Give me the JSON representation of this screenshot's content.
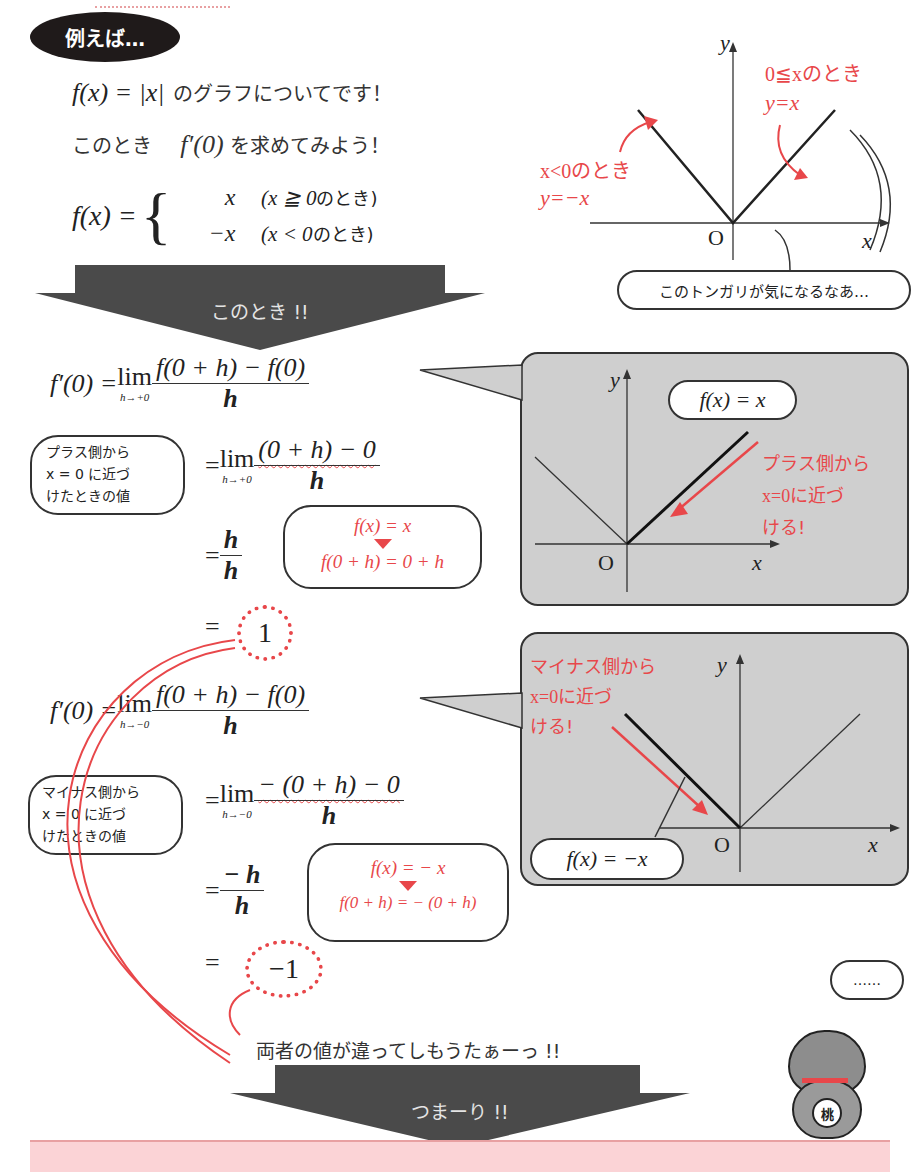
{
  "header": {
    "badge_label": "例えば…"
  },
  "intro": {
    "line1_math": "f(x) = |x|",
    "line1_text": "のグラフについてです！",
    "line2_text_a": "このとき",
    "line2_math": "f′(0)",
    "line2_text_b": "を求めてみよう！",
    "piecewise_lhs": "f(x) =",
    "case1_expr": "x",
    "case1_cond_math": "(x ≧ 0",
    "case1_cond_text": "のとき)",
    "case2_expr": "−x",
    "case2_cond_math": "(x < 0",
    "case2_cond_text": "のとき)"
  },
  "top_graph": {
    "y_label": "y",
    "x_label": "x",
    "origin_label": "O",
    "right_note_line1": "0≦xのとき",
    "right_note_line2": "y=x",
    "left_note_line1": "x<0のとき",
    "left_note_line2": "y=−x",
    "speech": "このトンガリが気になるなあ…"
  },
  "arrow1": {
    "label": "このとき !!"
  },
  "plus_side": {
    "line1_lhs": "f′(0) =",
    "lim_word": "lim",
    "lim_sub": "h→+0",
    "line1_num": "f(0 + h) − f(0)",
    "line1_den": "h",
    "line2_num": "(0 + h) − 0",
    "line2_den": "h",
    "line3_num": "h",
    "line3_den": "h",
    "result": "1",
    "eq": "=",
    "bubble_left": [
      "プラス側から",
      "x = 0 に近づ",
      "けたときの値"
    ],
    "bubble_hint_line1": "f(x) = x",
    "bubble_hint_line2": "f(0 + h) = 0 + h"
  },
  "plus_graph": {
    "y_label": "y",
    "x_label": "x",
    "origin_label": "O",
    "func_label": "f(x) = x",
    "note": [
      "プラス側から",
      "x=0に近づ",
      "ける!"
    ]
  },
  "minus_side": {
    "line1_lhs": "f′(0) =",
    "lim_word": "lim",
    "lim_sub": "h→−0",
    "line1_num": "f(0 + h) − f(0)",
    "line1_den": "h",
    "line2_num": "− (0 + h) − 0",
    "line2_den": "h",
    "line3_num": "− h",
    "line3_den": "h",
    "result": "−1",
    "eq": "=",
    "bubble_left": [
      "マイナス側から",
      "x = 0 に近づ",
      "けたときの値"
    ],
    "bubble_hint_line1": "f(x) = − x",
    "bubble_hint_line2": "f(0 + h) = − (0 + h)"
  },
  "minus_graph": {
    "y_label": "y",
    "x_label": "x",
    "origin_label": "O",
    "func_label": "f(x) = −x",
    "note": [
      "マイナス側から",
      "x=0に近づ",
      "ける!"
    ]
  },
  "conclusion": {
    "mismatch_text": "両者の値が違ってしもうたぁーっ !!",
    "cat_speech": "……",
    "cat_badge": "桃",
    "arrow2_label": "つまーり !!"
  },
  "colors": {
    "accent_red": "#e8474a",
    "arrow_gray": "#4a4a4a",
    "panel_gray": "#cfcfcf",
    "pink_box": "#fbd3d6"
  }
}
